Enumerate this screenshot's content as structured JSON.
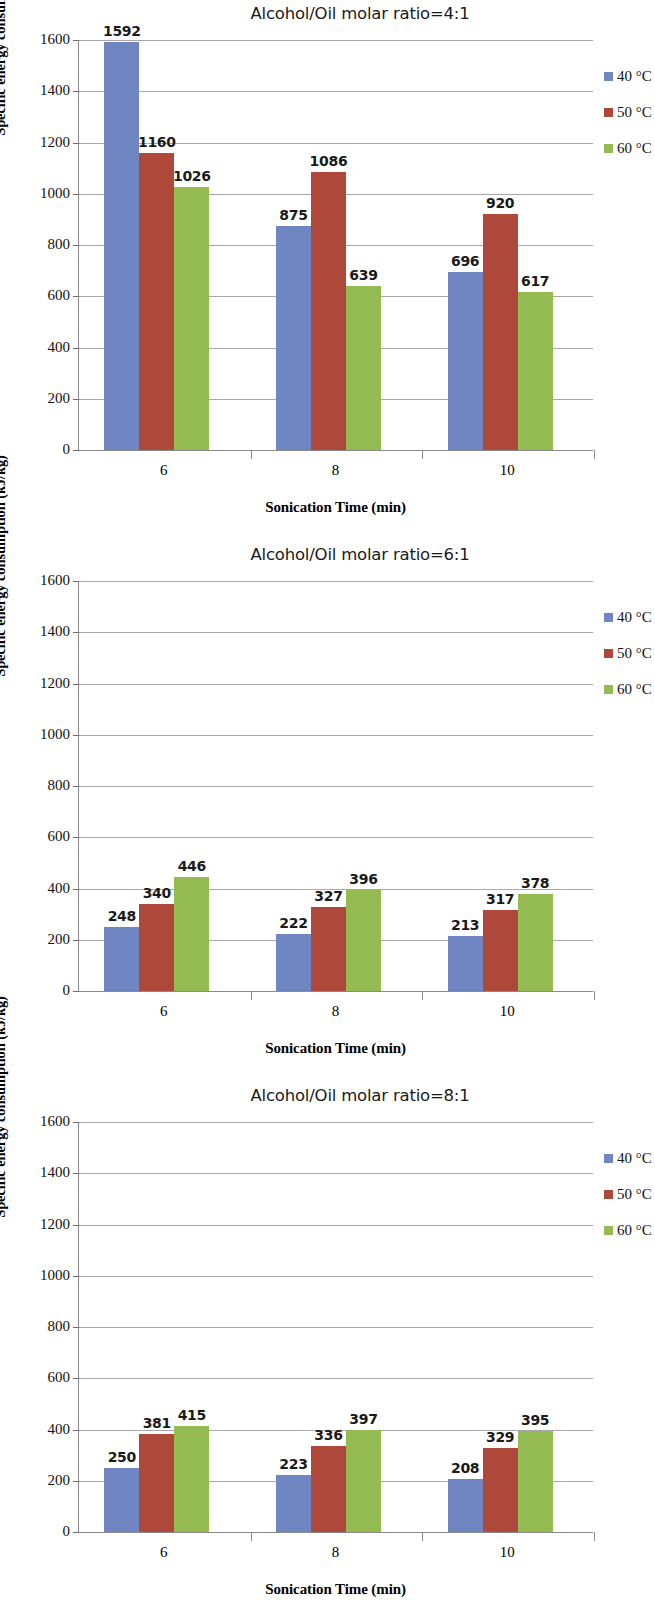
{
  "figure": {
    "axis_y_title": "Specific energy consumption (kJ/kg)",
    "axis_x_title": "Sonication Time (min)",
    "colors": {
      "series_40C": "#6f86c2",
      "series_50C": "#ae483b",
      "series_60C": "#94ba52",
      "gridline": "#a8a8a8",
      "axis": "#8a8a8a"
    },
    "legend": [
      {
        "label": "40 °C",
        "color": "#6f86c2"
      },
      {
        "label": "50 °C",
        "color": "#ae483b"
      },
      {
        "label": "60 °C",
        "color": "#94ba52"
      }
    ],
    "y_ticks": [
      "1600",
      "1400",
      "1200",
      "1000",
      "800",
      "600",
      "400",
      "200",
      "0"
    ],
    "x_ticks": [
      "6",
      "8",
      "10"
    ]
  },
  "chart_data": [
    {
      "type": "bar",
      "title": "Alcohol/Oil molar ratio=4:1",
      "xlabel": "Sonication Time (min)",
      "ylabel": "Specific energy consumption (kJ/kg)",
      "categories": [
        "6",
        "8",
        "10"
      ],
      "ylim": [
        0,
        1600
      ],
      "ytick_step": 200,
      "grid": true,
      "legend_position": "right",
      "series": [
        {
          "name": "40 °C",
          "color": "#6f86c2",
          "values": [
            1592,
            875,
            696
          ]
        },
        {
          "name": "50 °C",
          "color": "#ae483b",
          "values": [
            1160,
            1086,
            920
          ]
        },
        {
          "name": "60 °C",
          "color": "#94ba52",
          "values": [
            1026,
            639,
            617
          ]
        }
      ]
    },
    {
      "type": "bar",
      "title": "Alcohol/Oil molar ratio=6:1",
      "xlabel": "Sonication Time (min)",
      "ylabel": "Specific energy consumption (kJ/kg)",
      "categories": [
        "6",
        "8",
        "10"
      ],
      "ylim": [
        0,
        1600
      ],
      "ytick_step": 200,
      "grid": true,
      "legend_position": "right",
      "series": [
        {
          "name": "40 °C",
          "color": "#6f86c2",
          "values": [
            248,
            222,
            213
          ]
        },
        {
          "name": "50 °C",
          "color": "#ae483b",
          "values": [
            340,
            327,
            317
          ]
        },
        {
          "name": "60 °C",
          "color": "#94ba52",
          "values": [
            446,
            396,
            378
          ]
        }
      ]
    },
    {
      "type": "bar",
      "title": "Alcohol/Oil molar ratio=8:1",
      "xlabel": "Sonication Time (min)",
      "ylabel": "Specific energy consumption (kJ/kg)",
      "categories": [
        "6",
        "8",
        "10"
      ],
      "ylim": [
        0,
        1600
      ],
      "ytick_step": 200,
      "grid": true,
      "legend_position": "right",
      "series": [
        {
          "name": "40 °C",
          "color": "#6f86c2",
          "values": [
            250,
            223,
            208
          ]
        },
        {
          "name": "50 °C",
          "color": "#ae483b",
          "values": [
            381,
            336,
            329
          ]
        },
        {
          "name": "60 °C",
          "color": "#94ba52",
          "values": [
            415,
            397,
            395
          ]
        }
      ]
    }
  ]
}
